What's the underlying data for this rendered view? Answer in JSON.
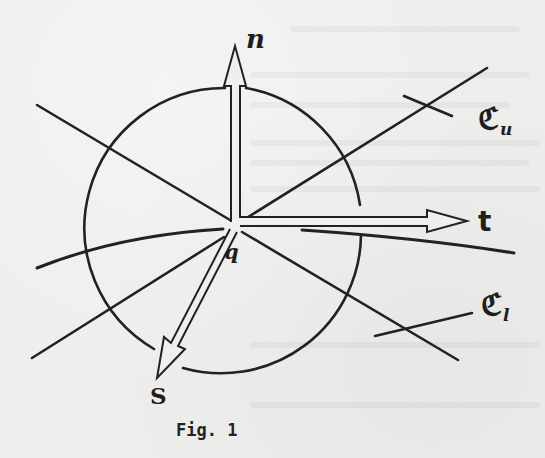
{
  "figure": {
    "caption": "Fig. 1",
    "labels": {
      "normal": "n",
      "tangent": "t",
      "binormal": "S",
      "point": "q",
      "upper_cone": {
        "main": "ℭ",
        "sub": "u"
      },
      "lower_cone": {
        "main": "ℭ",
        "sub": "l"
      }
    },
    "elements": [
      {
        "type": "circle",
        "center": [
          234,
          225
        ],
        "radius": 140,
        "gaps": [
          "top near n arrow",
          "bottom near S arrow"
        ]
      },
      {
        "type": "arrow",
        "name": "n",
        "from": [
          235,
          225
        ],
        "to": [
          235,
          46
        ]
      },
      {
        "type": "arrow",
        "name": "t",
        "from": [
          236,
          225
        ],
        "to": [
          447,
          224
        ]
      },
      {
        "type": "arrow",
        "name": "S",
        "from": [
          236,
          225
        ],
        "to": [
          157,
          378
        ]
      },
      {
        "type": "line",
        "name": "upper cone line",
        "from": [
          37,
          105
        ],
        "to": [
          487,
          68
        ],
        "via": [
          236,
          225
        ]
      },
      {
        "type": "line",
        "name": "lower cone line",
        "from": [
          32,
          358
        ],
        "to": [
          458,
          360
        ],
        "via": [
          236,
          225
        ]
      },
      {
        "type": "curve",
        "name": "surface curve",
        "from": [
          37,
          268
        ],
        "to": [
          514,
          253
        ],
        "via": [
          236,
          225
        ]
      }
    ],
    "colors": {
      "ink": "#222222",
      "paper": "#eeeeec"
    }
  }
}
